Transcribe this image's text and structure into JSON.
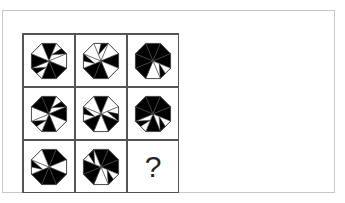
{
  "puzzle": {
    "title": "",
    "question_mark": "?",
    "colors": {
      "fill": "#000000",
      "empty": "#ffffff",
      "stroke": "#444444",
      "grid": "#555555",
      "frame": "#c8c8c8"
    },
    "rows": 3,
    "cols": 3,
    "cells": [
      {
        "row": 0,
        "col": 0,
        "kind": "octagon-pinwheel",
        "black_sectors": [
          0,
          3,
          4,
          6
        ],
        "blades": [
          1,
          5
        ]
      },
      {
        "row": 0,
        "col": 1,
        "kind": "octagon-pinwheel",
        "black_sectors": [
          2,
          4,
          5
        ],
        "blades": [
          0,
          6
        ]
      },
      {
        "row": 0,
        "col": 2,
        "kind": "octagon-pinwheel",
        "black_sectors": [
          0,
          1,
          2,
          5,
          6,
          7
        ],
        "blades": [
          3
        ]
      },
      {
        "row": 1,
        "col": 0,
        "kind": "octagon-pinwheel",
        "black_sectors": [
          0,
          2,
          4,
          7
        ],
        "blades": [
          1,
          5
        ]
      },
      {
        "row": 1,
        "col": 1,
        "kind": "octagon-pinwheel",
        "black_sectors": [
          0,
          3,
          5
        ],
        "blades": [
          2,
          6
        ]
      },
      {
        "row": 1,
        "col": 2,
        "kind": "octagon-pinwheel",
        "black_sectors": [
          0,
          1,
          2,
          4,
          6,
          7
        ],
        "blades": [
          3,
          5
        ]
      },
      {
        "row": 2,
        "col": 0,
        "kind": "octagon-pinwheel",
        "black_sectors": [
          0,
          1,
          3,
          4,
          5
        ],
        "blades": [
          6
        ]
      },
      {
        "row": 2,
        "col": 1,
        "kind": "octagon-pinwheel",
        "black_sectors": [
          0,
          1,
          2,
          5,
          6
        ],
        "blades": [
          3,
          7
        ]
      },
      {
        "row": 2,
        "col": 2,
        "kind": "question"
      }
    ]
  }
}
